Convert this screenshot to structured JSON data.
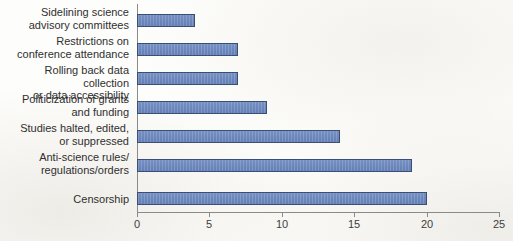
{
  "chart_data": {
    "type": "bar",
    "orientation": "horizontal",
    "title": "",
    "subtitle": "",
    "xlabel": "",
    "ylabel": "",
    "categories": [
      "Censorship",
      "Anti-science rules/\nregulations/orders",
      "Studies halted, edited,\nor suppressed",
      "Politicization of grants\nand funding",
      "Rolling back data collection\nor data accessibility",
      "Restrictions on\nconference attendance",
      "Sidelining science\nadvisory committees"
    ],
    "values": [
      20,
      19,
      14,
      9,
      7,
      7,
      4
    ],
    "xlim": [
      0,
      25
    ],
    "xticks": [
      0,
      5,
      10,
      15,
      20,
      25
    ],
    "xtick_labels": [
      "0",
      "5",
      "10",
      "15",
      "20",
      "25"
    ],
    "grid": false,
    "legend": "none",
    "colors": {
      "bar_fill": "#6b86bb",
      "bar_edge": "#3b4f74",
      "axis": "#8a8a88",
      "text": "#2f2f2f",
      "background": "#fdfdfb"
    }
  },
  "axis": {
    "x_min": 0,
    "x_max": 25,
    "tick_step": 5
  }
}
